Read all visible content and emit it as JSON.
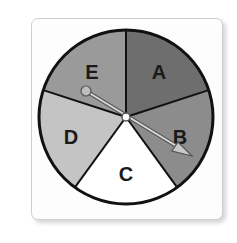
{
  "spinner": {
    "sections": [
      {
        "label": "A",
        "color": "#6e6e6e"
      },
      {
        "label": "B",
        "color": "#8c8c8c"
      },
      {
        "label": "C",
        "color": "#ffffff"
      },
      {
        "label": "D",
        "color": "#c4c4c4"
      },
      {
        "label": "E",
        "color": "#9a9a9a"
      }
    ],
    "pointer_points_to": "B",
    "outline_color": "#111111"
  }
}
